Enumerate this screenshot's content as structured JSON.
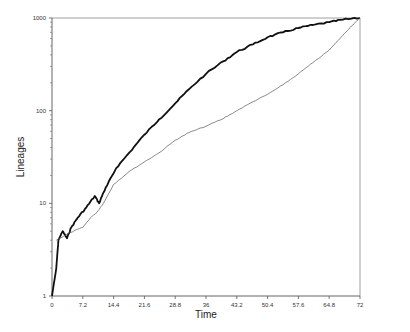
{
  "chart_data": {
    "type": "line",
    "title": "",
    "xlabel": "Time",
    "ylabel": "Lineages",
    "xlim": [
      0,
      72
    ],
    "ylim": [
      1,
      1000
    ],
    "yscale": "log",
    "grid": false,
    "legend": null,
    "x_ticks": [
      "0",
      "7.2",
      "14.4",
      "21.6",
      "28.8",
      "36",
      "43.2",
      "50.4",
      "57.6",
      "64.8",
      "72"
    ],
    "y_ticks": [
      "1",
      "10",
      "100",
      "1000"
    ],
    "series": [
      {
        "name": "thick",
        "style": "bold",
        "x": [
          0,
          1,
          1.5,
          2.5,
          3.5,
          4.5,
          6,
          8,
          10,
          11,
          12,
          13,
          15,
          18,
          21.6,
          25,
          28.8,
          32,
          36,
          40,
          43.2,
          47,
          50.4,
          54,
          57.6,
          61,
          64.8,
          68,
          72
        ],
        "y": [
          1,
          2,
          4,
          5,
          4.2,
          5.5,
          7,
          9,
          12,
          10,
          13,
          16,
          24,
          35,
          55,
          80,
          120,
          170,
          250,
          340,
          430,
          520,
          620,
          700,
          780,
          840,
          900,
          960,
          1000
        ]
      },
      {
        "name": "thin",
        "style": "thin",
        "x": [
          1,
          3,
          5,
          7.2,
          9,
          10.5,
          12,
          14.4,
          18,
          21.6,
          25,
          28.8,
          32,
          36,
          40,
          43.2,
          47,
          50.4,
          54,
          57.6,
          61,
          64.8,
          68,
          70,
          72
        ],
        "y": [
          4,
          4.5,
          5,
          5.5,
          7,
          8,
          10,
          16,
          22,
          28,
          35,
          48,
          58,
          68,
          82,
          100,
          125,
          150,
          190,
          250,
          330,
          450,
          650,
          820,
          1000
        ]
      }
    ]
  }
}
